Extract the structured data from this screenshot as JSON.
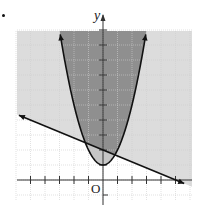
{
  "chart_data": {
    "type": "inequality-graph",
    "title": "",
    "xlabel": "",
    "ylabel": "y",
    "origin_label": "O",
    "xlim": [
      -6,
      6
    ],
    "ylim": [
      -1.4,
      10
    ],
    "grid": true,
    "x_ticks": [
      -5,
      -4,
      -3,
      -2,
      -1,
      1,
      2,
      3,
      4,
      5
    ],
    "y_ticks": [
      1,
      2,
      3,
      4,
      5,
      6,
      7,
      8,
      9,
      10
    ],
    "series": [
      {
        "name": "parabola",
        "equation": "y = x^2 + 1",
        "vertex": [
          0,
          1
        ],
        "x_range": [
          -2.95,
          2.95
        ],
        "style": "solid",
        "arrows": "both",
        "shade": "inside (above)"
      },
      {
        "name": "line",
        "equation": "y = -0.4x + 2",
        "y_intercept": 2,
        "x_intercept": 5,
        "x_range": [
          -5.8,
          5.6
        ],
        "style": "solid",
        "arrows": "both",
        "shade": "above"
      }
    ],
    "regions": [
      {
        "name": "above-line-only",
        "color": "#dcdcdc"
      },
      {
        "name": "inside-parabola-above-line",
        "color": "#8f8f8f"
      },
      {
        "name": "inside-parabola-below-line",
        "color": "#c6c6c6"
      }
    ],
    "colors": {
      "curve": "#111111",
      "axis": "#333333",
      "grid": "#cfcfcf"
    }
  },
  "labels": {
    "y_axis": "y",
    "origin": "O"
  }
}
